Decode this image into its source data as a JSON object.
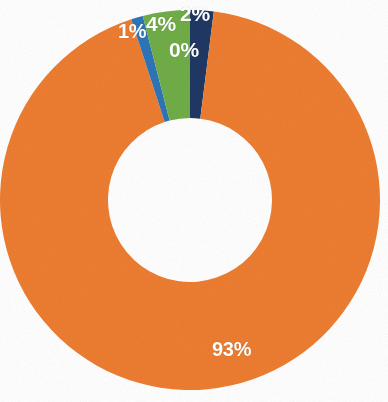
{
  "chart_data": {
    "type": "pie",
    "variant": "donut",
    "title": "",
    "subtitle": "",
    "xlabel": "",
    "ylabel": "",
    "legend": "none",
    "grid": false,
    "data_labels": "percentage",
    "hole_ratio": 0.43,
    "start_angle_deg": -90,
    "direction": "clockwise",
    "categories": [
      "Series 1",
      "Series 2",
      "Series 3",
      "Series 4",
      "Series 5"
    ],
    "labels": [
      "93%",
      "1%",
      "4%",
      "2%",
      "0%"
    ],
    "values": [
      93,
      1,
      4,
      2,
      0
    ],
    "colors": [
      "#ED7D31",
      "#2E75B6",
      "#70AD47",
      "#1F3864",
      "#1F3864"
    ],
    "slices": [
      {
        "label": "93%",
        "value": 93,
        "color": "#ED7D31",
        "name": "orange-slice"
      },
      {
        "label": "1%",
        "value": 1,
        "color": "#2E75B6",
        "name": "blue-slice"
      },
      {
        "label": "4%",
        "value": 4,
        "color": "#70AD47",
        "name": "green-slice"
      },
      {
        "label": "2%",
        "value": 2,
        "color": "#1F3864",
        "name": "navy-slice"
      },
      {
        "label": "0%",
        "value": 0,
        "color": "#1F3864",
        "name": "zero-slice"
      }
    ]
  },
  "labels": {
    "pct_93": "93%",
    "pct_1": "1%",
    "pct_4": "4%",
    "pct_2": "2%",
    "pct_0": "0%"
  },
  "colors": {
    "orange": "#ED7D31",
    "blue": "#2E75B6",
    "green": "#70AD47",
    "navy": "#1F3864",
    "background": "#ffffff",
    "label_text": "#ffffff"
  }
}
